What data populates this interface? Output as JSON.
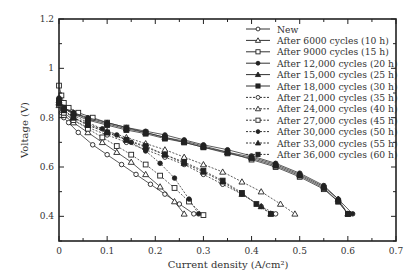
{
  "chart_data": {
    "type": "line",
    "title": "",
    "xlabel": "Current density (A/cm²)",
    "ylabel": "Voltage (V)",
    "xlim": [
      0,
      0.7
    ],
    "ylim": [
      0.3,
      1.2
    ],
    "xticks": [
      "0",
      "0.1",
      "0.2",
      "0.3",
      "0.4",
      "0.5",
      "0.6",
      "0.7"
    ],
    "yticks": [
      "0.4",
      "0.6",
      "0.8",
      "1",
      "1.2"
    ],
    "grid": false,
    "legend_position": "upper right",
    "series": [
      {
        "name": "New",
        "marker": "circle-open",
        "dash": "solid",
        "x": [
          0,
          0.005,
          0.01,
          0.02,
          0.04,
          0.07,
          0.1,
          0.13,
          0.16,
          0.19,
          0.22,
          0.25,
          0.28
        ],
        "y": [
          0.86,
          0.82,
          0.8,
          0.78,
          0.74,
          0.69,
          0.65,
          0.61,
          0.57,
          0.53,
          0.49,
          0.45,
          0.41
        ]
      },
      {
        "name": "After 6000 cycles (10 h)",
        "marker": "triangle-open",
        "dash": "solid",
        "x": [
          0,
          0.01,
          0.03,
          0.06,
          0.09,
          0.12,
          0.15,
          0.18,
          0.21,
          0.24,
          0.26
        ],
        "y": [
          0.85,
          0.81,
          0.78,
          0.74,
          0.7,
          0.66,
          0.62,
          0.57,
          0.52,
          0.46,
          0.41
        ]
      },
      {
        "name": "After 9000 cycles (15 h)",
        "marker": "square-open",
        "dash": "solid",
        "x": [
          0,
          0.005,
          0.01,
          0.02,
          0.04,
          0.07,
          0.1,
          0.14,
          0.18,
          0.22,
          0.26,
          0.3,
          0.35,
          0.4,
          0.45,
          0.5,
          0.55,
          0.58,
          0.6
        ],
        "y": [
          0.93,
          0.89,
          0.86,
          0.84,
          0.82,
          0.8,
          0.78,
          0.76,
          0.74,
          0.72,
          0.7,
          0.68,
          0.66,
          0.63,
          0.6,
          0.56,
          0.51,
          0.46,
          0.41
        ]
      },
      {
        "name": "After 12,000 cycles (20 h)",
        "marker": "circle-filled",
        "dash": "solid",
        "x": [
          0,
          0.01,
          0.03,
          0.06,
          0.1,
          0.14,
          0.18,
          0.22,
          0.26,
          0.3,
          0.35,
          0.4,
          0.45,
          0.5,
          0.55,
          0.58,
          0.61
        ],
        "y": [
          0.88,
          0.84,
          0.82,
          0.8,
          0.78,
          0.76,
          0.745,
          0.73,
          0.71,
          0.69,
          0.67,
          0.645,
          0.615,
          0.575,
          0.525,
          0.47,
          0.41
        ]
      },
      {
        "name": "After 15,000 cycles (25 h)",
        "marker": "triangle-filled",
        "dash": "solid",
        "x": [
          0,
          0.01,
          0.03,
          0.06,
          0.1,
          0.14,
          0.18,
          0.22,
          0.26,
          0.3,
          0.35,
          0.4,
          0.45,
          0.5,
          0.55,
          0.58,
          0.6
        ],
        "y": [
          0.87,
          0.84,
          0.82,
          0.795,
          0.775,
          0.755,
          0.74,
          0.72,
          0.705,
          0.685,
          0.66,
          0.64,
          0.61,
          0.57,
          0.52,
          0.47,
          0.41
        ]
      },
      {
        "name": "After 18,000 cycles (30 h)",
        "marker": "square-filled",
        "dash": "solid",
        "x": [
          0,
          0.01,
          0.03,
          0.06,
          0.1,
          0.14,
          0.18,
          0.22,
          0.26,
          0.3,
          0.35,
          0.4,
          0.45,
          0.5,
          0.55,
          0.58,
          0.6
        ],
        "y": [
          0.87,
          0.84,
          0.815,
          0.79,
          0.77,
          0.75,
          0.735,
          0.715,
          0.7,
          0.68,
          0.655,
          0.635,
          0.605,
          0.565,
          0.515,
          0.46,
          0.41
        ]
      },
      {
        "name": "After 21,000 cycles (35 h)",
        "marker": "circle-open",
        "dash": "dashed",
        "x": [
          0,
          0.01,
          0.03,
          0.06,
          0.1,
          0.14,
          0.18,
          0.22,
          0.26,
          0.3,
          0.34,
          0.38,
          0.42,
          0.45
        ],
        "y": [
          0.85,
          0.82,
          0.79,
          0.76,
          0.73,
          0.7,
          0.67,
          0.64,
          0.61,
          0.57,
          0.53,
          0.49,
          0.44,
          0.41
        ]
      },
      {
        "name": "After 24,000 cycles (40 h)",
        "marker": "triangle-open",
        "dash": "dashed",
        "x": [
          0,
          0.01,
          0.03,
          0.06,
          0.1,
          0.14,
          0.18,
          0.22,
          0.26,
          0.3,
          0.34,
          0.38,
          0.42,
          0.46,
          0.49
        ],
        "y": [
          0.86,
          0.83,
          0.8,
          0.775,
          0.745,
          0.72,
          0.695,
          0.67,
          0.64,
          0.61,
          0.58,
          0.54,
          0.5,
          0.45,
          0.41
        ]
      },
      {
        "name": "After 27,000 cycles (45 h)",
        "marker": "square-open",
        "dash": "dashed",
        "x": [
          0,
          0.01,
          0.03,
          0.06,
          0.09,
          0.12,
          0.15,
          0.18,
          0.21,
          0.24,
          0.27,
          0.3
        ],
        "y": [
          0.86,
          0.82,
          0.79,
          0.755,
          0.72,
          0.685,
          0.65,
          0.61,
          0.565,
          0.515,
          0.46,
          0.405
        ]
      },
      {
        "name": "After 30,000 cycles (50 h)",
        "marker": "circle-filled",
        "dash": "dashed",
        "x": [
          0,
          0.01,
          0.03,
          0.06,
          0.09,
          0.12,
          0.15,
          0.18,
          0.21,
          0.24,
          0.27,
          0.29
        ],
        "y": [
          0.87,
          0.84,
          0.81,
          0.78,
          0.755,
          0.73,
          0.7,
          0.665,
          0.615,
          0.555,
          0.47,
          0.41
        ]
      },
      {
        "name": "After 33,000 cycles (55 h)",
        "marker": "triangle-filled",
        "dash": "dashed",
        "x": [
          0,
          0.01,
          0.03,
          0.06,
          0.1,
          0.14,
          0.18,
          0.22,
          0.26,
          0.3,
          0.34,
          0.38,
          0.42,
          0.44
        ],
        "y": [
          0.86,
          0.83,
          0.8,
          0.77,
          0.74,
          0.71,
          0.68,
          0.65,
          0.615,
          0.58,
          0.54,
          0.49,
          0.44,
          0.41
        ]
      },
      {
        "name": "After 36,000 cycles (60 h)",
        "marker": "square-filled",
        "dash": "dashed",
        "x": [
          0,
          0.01,
          0.03,
          0.06,
          0.1,
          0.14,
          0.18,
          0.22,
          0.26,
          0.3,
          0.34,
          0.38,
          0.41,
          0.44
        ],
        "y": [
          0.86,
          0.83,
          0.8,
          0.77,
          0.74,
          0.71,
          0.685,
          0.65,
          0.62,
          0.585,
          0.545,
          0.495,
          0.45,
          0.41
        ]
      }
    ]
  }
}
